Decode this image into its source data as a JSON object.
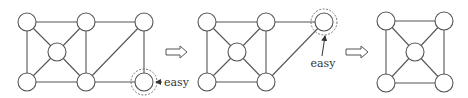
{
  "diagram": {
    "colors": {
      "stroke": "#555555",
      "node_fill": "#ffffff",
      "background": "#ffffff",
      "dashed_ring": "#666666",
      "text": "#333333"
    },
    "node_radius": 9,
    "graphs": [
      {
        "id": "graph-1",
        "nodes": [
          {
            "id": "a",
            "x": 27,
            "y": 22
          },
          {
            "id": "b",
            "x": 86,
            "y": 22
          },
          {
            "id": "c",
            "x": 144,
            "y": 22
          },
          {
            "id": "m",
            "x": 57,
            "y": 52
          },
          {
            "id": "d",
            "x": 27,
            "y": 82
          },
          {
            "id": "e",
            "x": 86,
            "y": 82
          },
          {
            "id": "f",
            "x": 144,
            "y": 82,
            "highlight": true
          }
        ],
        "edges": [
          [
            "a",
            "b"
          ],
          [
            "b",
            "c"
          ],
          [
            "a",
            "d"
          ],
          [
            "a",
            "m"
          ],
          [
            "b",
            "m"
          ],
          [
            "m",
            "d"
          ],
          [
            "m",
            "e"
          ],
          [
            "b",
            "e"
          ],
          [
            "d",
            "e"
          ],
          [
            "e",
            "c"
          ],
          [
            "c",
            "f"
          ],
          [
            "e",
            "f"
          ]
        ],
        "annotation": {
          "label": "easy",
          "target": "f",
          "arrow_from": [
            162,
            82
          ],
          "arrow_to": [
            156,
            82
          ],
          "text_x": 164,
          "text_y": 86
        }
      },
      {
        "id": "graph-2",
        "nodes": [
          {
            "id": "a",
            "x": 207,
            "y": 22
          },
          {
            "id": "b",
            "x": 266,
            "y": 22
          },
          {
            "id": "c",
            "x": 324,
            "y": 22,
            "highlight": true
          },
          {
            "id": "m",
            "x": 237,
            "y": 52
          },
          {
            "id": "d",
            "x": 207,
            "y": 82
          },
          {
            "id": "e",
            "x": 266,
            "y": 82
          }
        ],
        "edges": [
          [
            "a",
            "b"
          ],
          [
            "b",
            "c"
          ],
          [
            "a",
            "d"
          ],
          [
            "a",
            "m"
          ],
          [
            "b",
            "m"
          ],
          [
            "m",
            "d"
          ],
          [
            "m",
            "e"
          ],
          [
            "b",
            "e"
          ],
          [
            "d",
            "e"
          ],
          [
            "e",
            "c"
          ]
        ],
        "annotation": {
          "label": "easy",
          "target": "c",
          "arrow_from": [
            322,
            56
          ],
          "arrow_to": [
            325,
            36
          ],
          "text_x": 323,
          "text_y": 67
        }
      },
      {
        "id": "graph-3",
        "nodes": [
          {
            "id": "a",
            "x": 386,
            "y": 21
          },
          {
            "id": "b",
            "x": 444,
            "y": 21
          },
          {
            "id": "m",
            "x": 415,
            "y": 52
          },
          {
            "id": "d",
            "x": 386,
            "y": 83
          },
          {
            "id": "e",
            "x": 444,
            "y": 83
          }
        ],
        "edges": [
          [
            "a",
            "b"
          ],
          [
            "a",
            "d"
          ],
          [
            "b",
            "e"
          ],
          [
            "d",
            "e"
          ],
          [
            "a",
            "m"
          ],
          [
            "b",
            "m"
          ],
          [
            "d",
            "m"
          ],
          [
            "e",
            "m"
          ]
        ]
      }
    ],
    "transitions": [
      {
        "id": "arrow-1",
        "x": 166,
        "y": 52,
        "width": 21
      },
      {
        "id": "arrow-2",
        "x": 346,
        "y": 52,
        "width": 22
      }
    ],
    "labels": {
      "easy_1": "easy",
      "easy_2": "easy"
    }
  }
}
